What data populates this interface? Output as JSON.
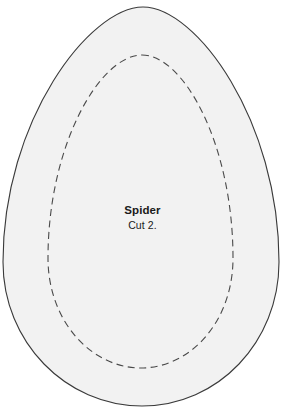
{
  "canvas": {
    "width": 285,
    "height": 419,
    "background_color": "#ffffff"
  },
  "pattern": {
    "name": "egg-sewing-pattern-piece",
    "title": "Spider",
    "instruction": "Cut 2.",
    "outline": {
      "name": "cut-line",
      "style": "solid",
      "stroke_color": "#3a3a3a",
      "stroke_width": 1.1,
      "fill_color": "#f2f2f2",
      "top_y": 7,
      "bottom_y": 406,
      "left_x": 3,
      "right_x": 279,
      "widest_y": 262,
      "path": "M 143 7 C 196 7 279 120 279 262 C 279 342 218 406 142 406 C 66 406 3 342 3 262 C 3 120 90 7 143 7 Z"
    },
    "inner_line": {
      "name": "stitch-line",
      "style": "dashed",
      "stroke_color": "#4a4a4a",
      "stroke_width": 1.1,
      "dash_length": 7,
      "dash_gap": 4.5,
      "fill_color": "none",
      "top_y": 55,
      "bottom_y": 368,
      "left_x": 48,
      "right_x": 233,
      "widest_y": 262,
      "path": "M 142 55 C 184 55 233 145 233 258 C 233 322 190 368 141 368 C 92 368 48 322 48 258 C 48 145 100 55 142 55 Z"
    }
  }
}
